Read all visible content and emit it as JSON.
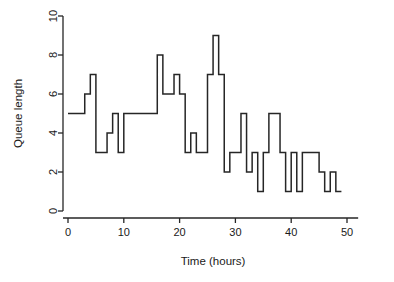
{
  "figure": {
    "background_color": "#ffffff",
    "line_color": "#262626",
    "text_color": "#1a1a1a"
  },
  "chart_data": {
    "type": "line",
    "subtype": "step-post",
    "title": "",
    "subtitle": "",
    "xlabel": "Time (hours)",
    "ylabel": "Queue length",
    "xlim": [
      -1,
      52
    ],
    "ylim": [
      -0.35,
      10.4
    ],
    "xticks": [
      0,
      10,
      20,
      30,
      40,
      50
    ],
    "xticklabels": [
      "0",
      "10",
      "20",
      "30",
      "40",
      "50"
    ],
    "yticks": [
      0,
      2,
      4,
      6,
      8,
      10
    ],
    "yticklabels": [
      "0",
      "2",
      "4",
      "6",
      "8",
      "10"
    ],
    "grid": false,
    "legend": null,
    "legend_position": "none",
    "series": [
      {
        "name": "Queue length",
        "color": "#262626",
        "x": [
          0,
          3,
          4,
          5,
          7,
          8,
          9,
          10,
          16,
          17,
          19,
          20,
          21,
          22,
          23,
          25,
          26,
          27,
          28,
          29,
          31,
          32,
          33,
          34,
          35,
          36,
          38,
          39,
          40,
          41,
          42,
          45,
          46,
          47,
          48,
          49
        ],
        "y": [
          5,
          6,
          7,
          3,
          4,
          5,
          3,
          5,
          8,
          6,
          7,
          6,
          3,
          4,
          3,
          7,
          9,
          7,
          2,
          3,
          5,
          2,
          3,
          1,
          3,
          5,
          3,
          1,
          3,
          1,
          3,
          2,
          1,
          2,
          1,
          1
        ]
      }
    ],
    "annotations": []
  }
}
